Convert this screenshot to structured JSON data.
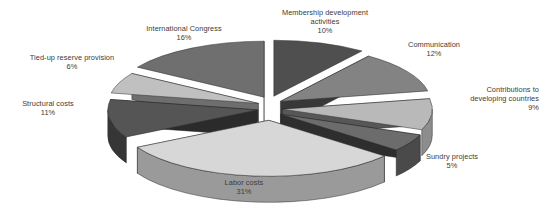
{
  "chart_data": {
    "type": "pie",
    "title": "",
    "subtitle": "",
    "xlabel": "",
    "ylabel": "",
    "style": "3d-exploded-pie",
    "grid": false,
    "legend_position": "none",
    "label_format": "name + percent",
    "total_percent": 100,
    "background_color": "#ffffff",
    "label_color": "#3b3b3b",
    "categories": [
      "Membership development activities",
      "Communication",
      "Contributions to developing countries",
      "Sundry projects",
      "Labor costs",
      "Structural costs",
      "Tied-up reserve provision",
      "International Congress"
    ],
    "values": [
      10,
      12,
      9,
      5,
      31,
      11,
      6,
      16
    ],
    "slices": [
      {
        "name": "Membership development activities",
        "label_line1": "Membership development",
        "label_line2": "activities",
        "percent_text": "10%",
        "value": 10,
        "top_color": "#4f4f4f",
        "side_color": "#2e2e2e"
      },
      {
        "name": "Communication",
        "label_line1": "Communication",
        "label_line2": "",
        "percent_text": "12%",
        "value": 12,
        "top_color": "#838383",
        "side_color": "#5a5a5a"
      },
      {
        "name": "Contributions to developing countries",
        "label_line1": "Contributions to",
        "label_line2": "developing countries",
        "percent_text": "9%",
        "value": 9,
        "top_color": "#b9b9b9",
        "side_color": "#8d8d8d"
      },
      {
        "name": "Sundry projects",
        "label_line1": "Sundry projects",
        "label_line2": "",
        "percent_text": "5%",
        "value": 5,
        "top_color": "#6c6c6c",
        "side_color": "#4a4a4a"
      },
      {
        "name": "Labor costs",
        "label_line1": "Labor costs",
        "label_line2": "",
        "percent_text": "31%",
        "value": 31,
        "top_color": "#d7d7d7",
        "side_color": "#9a9a9a"
      },
      {
        "name": "Structural costs",
        "label_line1": "Structural costs",
        "label_line2": "",
        "percent_text": "11%",
        "value": 11,
        "top_color": "#555555",
        "side_color": "#363636"
      },
      {
        "name": "Tied-up reserve provision",
        "label_line1": "Tied-up reserve provision",
        "label_line2": "",
        "percent_text": "6%",
        "value": 6,
        "top_color": "#c0c0c0",
        "side_color": "#8a8a8a"
      },
      {
        "name": "International Congress",
        "label_line1": "International Congress",
        "label_line2": "",
        "percent_text": "16%",
        "value": 16,
        "top_color": "#6f6f6f",
        "side_color": "#3f3f3f"
      }
    ]
  },
  "labels": {
    "membership": "Membership development\nactivities\n10%",
    "communication": "Communication\n12%",
    "contributions": "Contributions to\ndeveloping countries\n9%",
    "sundry": "Sundry projects\n5%",
    "labor": "Labor costs\n31%",
    "structural": "Structural costs\n11%",
    "tiedup": "Tied-up reserve provision\n6%",
    "congress": "International Congress\n16%"
  }
}
